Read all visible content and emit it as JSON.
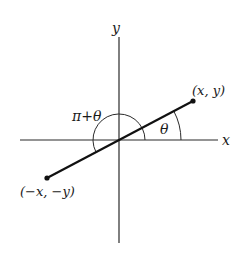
{
  "diagram": {
    "axes": {
      "x_label": "x",
      "y_label": "y"
    },
    "points": {
      "p1": {
        "label": "(x, y)"
      },
      "p2": {
        "label": "(−x, −y)"
      }
    },
    "angles": {
      "theta": {
        "label": "θ"
      },
      "pi_plus_theta": {
        "label": "π+θ"
      }
    },
    "colors": {
      "stroke": "#1a1a1a",
      "background": "#ffffff"
    }
  }
}
